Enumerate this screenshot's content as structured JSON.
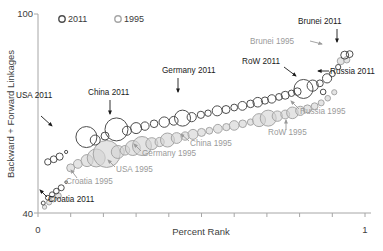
{
  "chart_data": {
    "type": "scatter",
    "title": "",
    "xlabel": "Percent Rank",
    "ylabel": "Backward + Forward Linkages",
    "xlim": [
      0,
      1
    ],
    "ylim": [
      40,
      100
    ],
    "xticks": [
      0,
      1
    ],
    "xtick_labels": [
      "0",
      "1"
    ],
    "yticks": [
      40,
      100
    ],
    "ytick_labels": [
      "40",
      "100"
    ],
    "grid": false,
    "legend_position": "top-center",
    "marker": "bubble",
    "series": [
      {
        "name": "2011",
        "color": "#4d4d4d",
        "fill": "none",
        "points": [
          {
            "x": 0.016,
            "y": 43.0,
            "r": 2.0
          },
          {
            "x": 0.03,
            "y": 44.6,
            "r": 2.4
          },
          {
            "x": 0.043,
            "y": 45.6,
            "r": 2.6
          },
          {
            "x": 0.056,
            "y": 46.6,
            "r": 2.8
          },
          {
            "x": 0.071,
            "y": 47.6,
            "r": 3.0
          },
          {
            "x": 0.086,
            "y": 49.3,
            "r": 1.3
          },
          {
            "x": 0.03,
            "y": 55.4,
            "r": 3.2
          },
          {
            "x": 0.048,
            "y": 56.2,
            "r": 3.4
          },
          {
            "x": 0.066,
            "y": 57.0,
            "r": 3.6
          },
          {
            "x": 0.086,
            "y": 58.4,
            "r": 1.6
          },
          {
            "x": 0.148,
            "y": 62.9,
            "r": 10.5
          },
          {
            "x": 0.175,
            "y": 62.0,
            "r": 5.0
          },
          {
            "x": 0.205,
            "y": 63.2,
            "r": 4.0
          },
          {
            "x": 0.24,
            "y": 65.2,
            "r": 11.5
          },
          {
            "x": 0.272,
            "y": 64.8,
            "r": 4.5
          },
          {
            "x": 0.3,
            "y": 65.6,
            "r": 5.5
          },
          {
            "x": 0.327,
            "y": 66.2,
            "r": 4.2
          },
          {
            "x": 0.355,
            "y": 66.9,
            "r": 3.8
          },
          {
            "x": 0.386,
            "y": 67.4,
            "r": 5.2
          },
          {
            "x": 0.415,
            "y": 67.8,
            "r": 4.4
          },
          {
            "x": 0.442,
            "y": 68.6,
            "r": 8.0
          },
          {
            "x": 0.47,
            "y": 68.9,
            "r": 4.6
          },
          {
            "x": 0.498,
            "y": 69.6,
            "r": 3.6
          },
          {
            "x": 0.52,
            "y": 70.1,
            "r": 3.2
          },
          {
            "x": 0.548,
            "y": 70.8,
            "r": 5.0
          },
          {
            "x": 0.575,
            "y": 71.2,
            "r": 4.0
          },
          {
            "x": 0.6,
            "y": 71.8,
            "r": 3.4
          },
          {
            "x": 0.625,
            "y": 72.3,
            "r": 4.4
          },
          {
            "x": 0.65,
            "y": 72.9,
            "r": 3.8
          },
          {
            "x": 0.672,
            "y": 73.4,
            "r": 4.8
          },
          {
            "x": 0.694,
            "y": 73.9,
            "r": 3.6
          },
          {
            "x": 0.715,
            "y": 74.4,
            "r": 4.2
          },
          {
            "x": 0.737,
            "y": 75.0,
            "r": 3.4
          },
          {
            "x": 0.756,
            "y": 75.5,
            "r": 4.0
          },
          {
            "x": 0.775,
            "y": 76.1,
            "r": 3.2
          },
          {
            "x": 0.793,
            "y": 76.6,
            "r": 3.8
          },
          {
            "x": 0.812,
            "y": 77.4,
            "r": 9.5
          },
          {
            "x": 0.84,
            "y": 78.4,
            "r": 5.6
          },
          {
            "x": 0.862,
            "y": 79.1,
            "r": 3.4
          },
          {
            "x": 0.872,
            "y": 76.5,
            "r": 2.8
          },
          {
            "x": 0.884,
            "y": 80.6,
            "r": 4.6
          },
          {
            "x": 0.9,
            "y": 82.0,
            "r": 3.0
          },
          {
            "x": 0.918,
            "y": 84.0,
            "r": 2.6
          },
          {
            "x": 0.938,
            "y": 87.6,
            "r": 4.0
          },
          {
            "x": 0.953,
            "y": 87.9,
            "r": 3.4
          }
        ]
      },
      {
        "name": "1995",
        "color": "#a6a6a6",
        "fill": "#d4d4d4",
        "points": [
          {
            "x": 0.02,
            "y": 41.8,
            "r": 2.2
          },
          {
            "x": 0.034,
            "y": 43.2,
            "r": 2.6
          },
          {
            "x": 0.048,
            "y": 44.2,
            "r": 2.8
          },
          {
            "x": 0.062,
            "y": 45.2,
            "r": 3.0
          },
          {
            "x": 0.1,
            "y": 53.6,
            "r": 4.0
          },
          {
            "x": 0.122,
            "y": 54.8,
            "r": 4.4
          },
          {
            "x": 0.15,
            "y": 55.8,
            "r": 6.0
          },
          {
            "x": 0.178,
            "y": 56.6,
            "r": 9.0
          },
          {
            "x": 0.21,
            "y": 57.8,
            "r": 13.5
          },
          {
            "x": 0.244,
            "y": 58.4,
            "r": 6.5
          },
          {
            "x": 0.266,
            "y": 58.9,
            "r": 4.8
          },
          {
            "x": 0.29,
            "y": 59.6,
            "r": 7.5
          },
          {
            "x": 0.318,
            "y": 60.2,
            "r": 9.5
          },
          {
            "x": 0.348,
            "y": 60.9,
            "r": 6.0
          },
          {
            "x": 0.372,
            "y": 61.4,
            "r": 4.6
          },
          {
            "x": 0.396,
            "y": 62.0,
            "r": 7.0
          },
          {
            "x": 0.424,
            "y": 62.6,
            "r": 5.4
          },
          {
            "x": 0.45,
            "y": 63.2,
            "r": 4.2
          },
          {
            "x": 0.474,
            "y": 63.7,
            "r": 5.0
          },
          {
            "x": 0.5,
            "y": 64.3,
            "r": 4.0
          },
          {
            "x": 0.524,
            "y": 64.8,
            "r": 3.4
          },
          {
            "x": 0.55,
            "y": 65.4,
            "r": 4.4
          },
          {
            "x": 0.576,
            "y": 65.9,
            "r": 3.6
          },
          {
            "x": 0.6,
            "y": 66.4,
            "r": 4.8
          },
          {
            "x": 0.626,
            "y": 66.9,
            "r": 3.8
          },
          {
            "x": 0.65,
            "y": 67.4,
            "r": 3.2
          },
          {
            "x": 0.676,
            "y": 68.0,
            "r": 6.5
          },
          {
            "x": 0.704,
            "y": 68.6,
            "r": 8.0
          },
          {
            "x": 0.732,
            "y": 69.2,
            "r": 5.2
          },
          {
            "x": 0.756,
            "y": 69.7,
            "r": 4.4
          },
          {
            "x": 0.778,
            "y": 70.2,
            "r": 5.8
          },
          {
            "x": 0.802,
            "y": 70.8,
            "r": 4.6
          },
          {
            "x": 0.824,
            "y": 71.4,
            "r": 4.0
          },
          {
            "x": 0.846,
            "y": 72.2,
            "r": 3.4
          },
          {
            "x": 0.866,
            "y": 73.2,
            "r": 3.0
          },
          {
            "x": 0.886,
            "y": 74.6,
            "r": 2.8
          },
          {
            "x": 0.906,
            "y": 76.4,
            "r": 2.6
          },
          {
            "x": 0.926,
            "y": 85.8,
            "r": 3.6
          },
          {
            "x": 0.944,
            "y": 86.2,
            "r": 3.2
          }
        ]
      }
    ],
    "annotations": [
      {
        "text": "USA 2011",
        "series": "2011",
        "label_x": 16,
        "label_y": 98,
        "align": "start",
        "arrow": {
          "x1": 41,
          "y1": 116,
          "x2": 52,
          "y2": 126
        }
      },
      {
        "text": "China 2011",
        "series": "2011",
        "label_x": 88,
        "label_y": 95,
        "align": "start",
        "arrow": {
          "x1": 110,
          "y1": 100,
          "x2": 110,
          "y2": 114
        }
      },
      {
        "text": "Germany 2011",
        "series": "2011",
        "label_x": 162,
        "label_y": 73,
        "align": "start",
        "arrow": {
          "x1": 178,
          "y1": 78,
          "x2": 178,
          "y2": 92
        }
      },
      {
        "text": "RoW 2011",
        "series": "2011",
        "label_x": 242,
        "label_y": 64,
        "align": "start",
        "arrow": {
          "x1": 284,
          "y1": 67,
          "x2": 296,
          "y2": 76
        }
      },
      {
        "text": "Brunei 2011",
        "series": "2011",
        "label_x": 298,
        "label_y": 24,
        "align": "start",
        "arrow": {
          "x1": 337,
          "y1": 29,
          "x2": 337,
          "y2": 42
        }
      },
      {
        "text": "Russia 2011",
        "series": "2011",
        "label_x": 330,
        "label_y": 74,
        "align": "start",
        "arrow": {
          "x1": 329,
          "y1": 71,
          "x2": 318,
          "y2": 71
        }
      },
      {
        "text": "Croatia 2011",
        "series": "2011",
        "label_x": 48,
        "label_y": 202,
        "align": "start",
        "arrow": {
          "x1": 47,
          "y1": 197,
          "x2": 40,
          "y2": 190
        }
      },
      {
        "text": "Croatia 1995",
        "series": "1995",
        "label_x": 66,
        "label_y": 184,
        "align": "start",
        "arrow": {
          "x1": 77,
          "y1": 178,
          "x2": 71,
          "y2": 170
        }
      },
      {
        "text": "USA 1995",
        "series": "1995",
        "label_x": 116,
        "label_y": 172,
        "align": "start",
        "arrow": {
          "x1": 115,
          "y1": 167,
          "x2": 108,
          "y2": 160
        }
      },
      {
        "text": "Germany 1995",
        "series": "1995",
        "label_x": 142,
        "label_y": 156,
        "align": "start",
        "arrow": {
          "x1": 141,
          "y1": 151,
          "x2": 134,
          "y2": 144
        }
      },
      {
        "text": "China 1995",
        "series": "1995",
        "label_x": 190,
        "label_y": 146,
        "align": "start",
        "arrow": {
          "x1": 189,
          "y1": 141,
          "x2": 181,
          "y2": 134
        }
      },
      {
        "text": "RoW 1995",
        "series": "1995",
        "label_x": 268,
        "label_y": 135,
        "align": "start",
        "arrow": {
          "x1": 286,
          "y1": 130,
          "x2": 286,
          "y2": 120
        }
      },
      {
        "text": "Russia 1995",
        "series": "1995",
        "label_x": 300,
        "label_y": 114,
        "align": "start",
        "arrow": {
          "x1": 299,
          "y1": 109,
          "x2": 291,
          "y2": 101
        }
      },
      {
        "text": "Brunei 1995",
        "series": "1995",
        "label_x": 250,
        "label_y": 44,
        "align": "start",
        "arrow": {
          "x1": 310,
          "y1": 41,
          "x2": 322,
          "y2": 44
        }
      }
    ]
  },
  "legend": {
    "items": [
      {
        "label": "2011",
        "marker": "circle-outline-dark",
        "color": "#4d4d4d"
      },
      {
        "label": "1995",
        "marker": "circle-outline-gray",
        "color": "#a6a6a6"
      }
    ]
  },
  "axes": {
    "y_title": "Backward + Forward Linkages",
    "y_top_label": "100",
    "y_bottom_label": "40",
    "x_title": "Percent Rank",
    "x_left_label": "0",
    "x_right_label": "1"
  },
  "colors": {
    "axis": "#a6a6a6",
    "text": "#404040",
    "series_2011": "#4d4d4d",
    "series_1995": "#a6a6a6",
    "series_1995_fill": "#d4d4d4"
  }
}
